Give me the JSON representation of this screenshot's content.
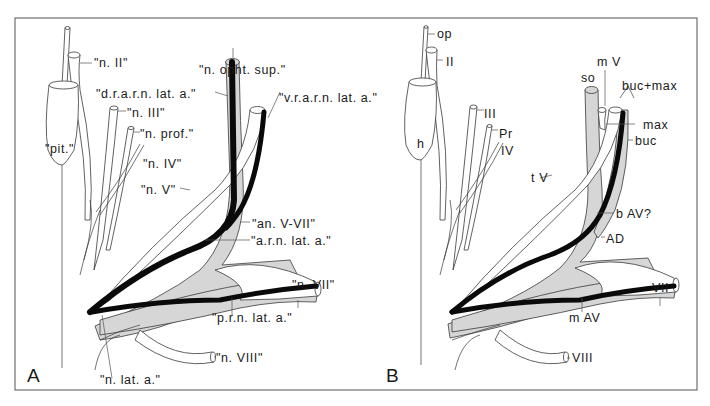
{
  "figure": {
    "frame_color": "#6e6e6e",
    "artery_color": "#0a0a0a",
    "vessel_fill": "#d6d6d6",
    "panels": [
      {
        "letter": "A",
        "labels": {
          "n_II": "\"n. II\"",
          "n_opht_sup": "\"n. opht. sup.\"",
          "d_r_a_r_n": "\"d.r.a.r.n. lat. a.\"",
          "v_r_a_r_n": "\"v.r.a.r.n. lat. a.\"",
          "n_III": "\"n. III\"",
          "n_prof": "\"n. prof.\"",
          "pit": "\"pit.\"",
          "n_IV": "\"n. IV\"",
          "n_V": "\"n. V\"",
          "an_V_VII": "\"an. V-VII\"",
          "a_r_n": "\"a.r.n. lat. a.\"",
          "n_VII": "\"n. VII\"",
          "p_r_n": "\"p.r.n. lat. a.\"",
          "n_VIII": "\"n. VIII\"",
          "n_lat_a": "\"n. lat. a.\""
        }
      },
      {
        "letter": "B",
        "labels": {
          "op": "op",
          "II": "II",
          "mV": "m V",
          "so": "so",
          "buc_max": "buc+max",
          "max": "max",
          "buc": "buc",
          "h": "h",
          "III": "III",
          "Pr": "Pr",
          "IV": "IV",
          "tV": "t V",
          "bAV": "b AV?",
          "AD": "AD",
          "VII": "VII",
          "mAV": "m AV",
          "VIII": "VIII"
        }
      }
    ]
  }
}
